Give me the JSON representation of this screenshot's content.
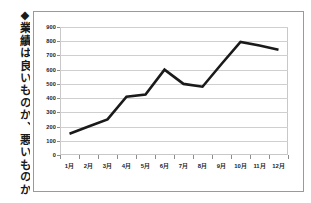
{
  "caption": {
    "marker": "◆",
    "text": "◆業績は良いものか、悪いものか"
  },
  "colors": {
    "line": "#1a1a1a",
    "grid": "#cfcfcf",
    "frame": "#9a9a9a",
    "plot_border": "#c8c8c8",
    "axis": "#8d8d8d",
    "background": "#ffffff",
    "text": "#222222"
  },
  "chart_data": {
    "type": "line",
    "title": "",
    "subtitle": "",
    "xlabel": "",
    "ylabel": "",
    "grid": true,
    "legend_position": "none",
    "ylim": [
      0,
      900
    ],
    "ytick_step": 100,
    "ytick_labels": [
      "0",
      "100",
      "200",
      "300",
      "400",
      "500",
      "600",
      "700",
      "800",
      "900"
    ],
    "ytick_values": [
      0,
      100,
      200,
      300,
      400,
      500,
      600,
      700,
      800,
      900
    ],
    "categories": [
      "1月",
      "2月",
      "3月",
      "4月",
      "5月",
      "6月",
      "7月",
      "8月",
      "9月",
      "10月",
      "11月",
      "12月"
    ],
    "series": [
      {
        "name": "業績",
        "values": [
          150,
          200,
          250,
          410,
          425,
          600,
          500,
          480,
          640,
          795,
          770,
          740
        ]
      }
    ]
  }
}
